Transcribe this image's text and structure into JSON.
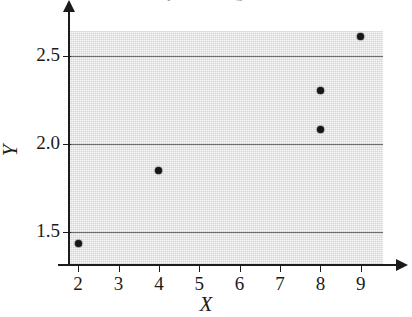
{
  "figure": {
    "title_remnant": "Scatterplot of Y against X",
    "background_color": "#ffffff",
    "panel_color": "#d4d4d4",
    "axis_color": "#1b1b1b",
    "gridline_color": "#6e6e6e",
    "point_color": "#161616"
  },
  "chart_data": {
    "type": "scatter",
    "title": "",
    "xlabel": "X",
    "ylabel": "Y",
    "xlim": [
      1.75,
      9.55
    ],
    "ylim": [
      1.31,
      2.64
    ],
    "grid": true,
    "legend": false,
    "x_ticks": [
      2,
      3,
      4,
      5,
      6,
      7,
      8,
      9
    ],
    "x_tick_labels": [
      "2",
      "3",
      "4",
      "5",
      "6",
      "7",
      "8",
      "9"
    ],
    "y_ticks": [
      1.5,
      2.0,
      2.5
    ],
    "y_tick_labels": [
      "1.5",
      "2.0",
      "2.5"
    ],
    "gridlines_y": [
      1.5,
      2.0,
      2.5
    ],
    "series": [
      {
        "name": "observations",
        "marker": "filled-circle",
        "points": [
          {
            "x": 2,
            "y": 1.43
          },
          {
            "x": 4,
            "y": 1.85
          },
          {
            "x": 8,
            "y": 2.08
          },
          {
            "x": 8,
            "y": 2.3
          },
          {
            "x": 9,
            "y": 2.61
          }
        ]
      }
    ]
  },
  "axes": {
    "x_axis_label": "X",
    "y_axis_label": "Y"
  }
}
